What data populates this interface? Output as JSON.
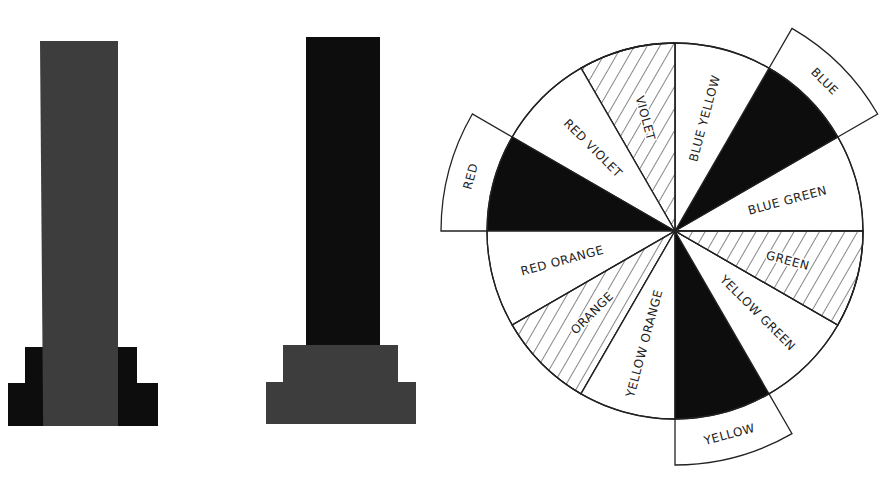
{
  "figures": {
    "pillar_1": {
      "description": "Gray column on black stepped base",
      "column_color": "#3d3d3d",
      "base_color": "#0d0d0d"
    },
    "pillar_2": {
      "description": "Black column on gray stepped base",
      "column_color": "#0d0d0d",
      "base_color": "#3d3d3d"
    },
    "color_wheel": {
      "segments": [
        {
          "label": "BLUE GREEN",
          "fill": "white",
          "tab": false
        },
        {
          "label": "BLUE",
          "fill": "black",
          "tab": true
        },
        {
          "label": "BLUE YELLOW",
          "fill": "white",
          "tab": false
        },
        {
          "label": "VIOLET",
          "fill": "hatched",
          "tab": false
        },
        {
          "label": "RED VIOLET",
          "fill": "white",
          "tab": false
        },
        {
          "label": "RED",
          "fill": "black",
          "tab": true
        },
        {
          "label": "RED ORANGE",
          "fill": "white",
          "tab": false
        },
        {
          "label": "ORANGE",
          "fill": "hatched",
          "tab": false
        },
        {
          "label": "YELLOW ORANGE",
          "fill": "white",
          "tab": false
        },
        {
          "label": "YELLOW",
          "fill": "black",
          "tab": true
        },
        {
          "label": "YELLOW GREEN",
          "fill": "white",
          "tab": false
        },
        {
          "label": "GREEN",
          "fill": "hatched",
          "tab": false
        }
      ]
    }
  },
  "colors": {
    "ink": "#0d0d0d",
    "dark_gray": "#3d3d3d",
    "paper": "#ffffff"
  }
}
